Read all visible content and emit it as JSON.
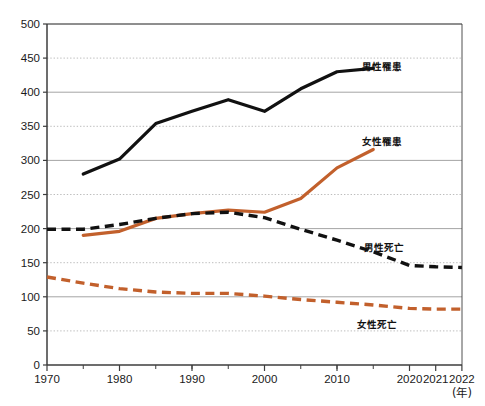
{
  "chart_data": {
    "type": "line",
    "title": "",
    "xlabel": "(年)",
    "ylabel": "",
    "xlim": [
      1970,
      2022
    ],
    "ylim": [
      0,
      500
    ],
    "ytick_step": 50,
    "grid": true,
    "legend_position": "inline-right",
    "xticks": [
      "1970",
      "1980",
      "1990",
      "2000",
      "2010",
      "2020",
      "2021",
      "2022"
    ],
    "xtick_values": [
      1970,
      1980,
      1990,
      2000,
      2010,
      2020,
      2021,
      2022
    ],
    "yticks": [
      "0",
      "50",
      "100",
      "150",
      "200",
      "250",
      "300",
      "350",
      "400",
      "450",
      "500"
    ],
    "ytick_values": [
      0,
      50,
      100,
      150,
      200,
      250,
      300,
      350,
      400,
      450,
      500
    ],
    "solid_gridlines": [
      100,
      200,
      300,
      400,
      500
    ],
    "dotted_gridlines": [
      50,
      150,
      250,
      350,
      450
    ],
    "colors": {
      "male": "#111111",
      "female": "#C2602C",
      "axis": "#3d3d3d",
      "grid_solid": "#9a9a9a",
      "grid_dotted": "#b5b5b5",
      "background": "#ffffff"
    },
    "series": [
      {
        "name": "男性罹患",
        "key": "male_incidence",
        "color": "#111111",
        "style": "solid",
        "label_x": 2013.5,
        "label_y": 437,
        "x": [
          1975,
          1980,
          1985,
          1990,
          1995,
          2000,
          2005,
          2010,
          2015
        ],
        "values": [
          280,
          302,
          354,
          372,
          389,
          372,
          405,
          430,
          435
        ]
      },
      {
        "name": "女性罹患",
        "key": "female_incidence",
        "color": "#C2602C",
        "style": "solid",
        "label_x": 2013.5,
        "label_y": 327,
        "x": [
          1975,
          1980,
          1985,
          1990,
          1995,
          2000,
          2005,
          2010,
          2015
        ],
        "values": [
          190,
          196,
          215,
          222,
          227,
          224,
          244,
          289,
          316
        ]
      },
      {
        "name": "男性死亡",
        "key": "male_mortality",
        "color": "#111111",
        "style": "dashed",
        "label_x": 2016.5,
        "label_y": 172,
        "x": [
          1970,
          1975,
          1980,
          1985,
          1990,
          1995,
          2000,
          2005,
          2010,
          2015,
          2020,
          2021,
          2022
        ],
        "values": [
          199,
          199,
          206,
          215,
          222,
          224,
          216,
          199,
          183,
          166,
          146,
          144,
          143
        ]
      },
      {
        "name": "女性死亡",
        "key": "female_mortality",
        "color": "#C2602C",
        "style": "dashed",
        "label_x": 2015.5,
        "label_y": 58,
        "x": [
          1970,
          1975,
          1980,
          1985,
          1990,
          1995,
          2000,
          2005,
          2010,
          2015,
          2020,
          2021,
          2022
        ],
        "values": [
          129,
          120,
          112,
          107,
          105,
          105,
          101,
          96,
          92,
          88,
          83,
          82,
          82
        ]
      }
    ]
  }
}
